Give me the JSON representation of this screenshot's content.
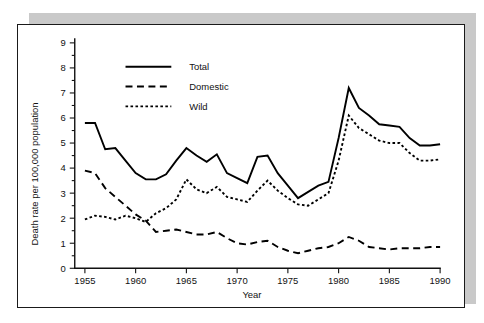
{
  "figure": {
    "panel_background": "#ffffff",
    "border_color": "#1a1a1a",
    "shadow_color": "#c9c9c9"
  },
  "chart_data": {
    "type": "line",
    "title": "",
    "xlabel": "Year",
    "ylabel": "Death rate per 100,000 population",
    "xlim": [
      1954,
      1990
    ],
    "ylim": [
      0,
      9
    ],
    "xticks": [
      1955,
      1960,
      1965,
      1970,
      1975,
      1980,
      1985,
      1990
    ],
    "xtick_labels": [
      "1955",
      "1960",
      "1965",
      "1970",
      "1975",
      "1980",
      "1985",
      "1990"
    ],
    "yticks": [
      0,
      1,
      2,
      3,
      4,
      5,
      6,
      7,
      8,
      9
    ],
    "ytick_labels": [
      "0",
      "1",
      "2",
      "3",
      "4",
      "5",
      "6",
      "7",
      "8",
      "9"
    ],
    "y_minor_ticks": true,
    "grid": false,
    "legend_position": "upper-left",
    "x": [
      1955,
      1956,
      1957,
      1958,
      1959,
      1960,
      1961,
      1962,
      1963,
      1964,
      1965,
      1966,
      1967,
      1968,
      1969,
      1970,
      1971,
      1972,
      1973,
      1974,
      1975,
      1976,
      1977,
      1978,
      1979,
      1980,
      1981,
      1982,
      1983,
      1984,
      1985,
      1986,
      1987,
      1988,
      1989,
      1990
    ],
    "series": [
      {
        "name": "Total",
        "line_style": "solid",
        "color": "#000000",
        "values": [
          5.8,
          5.8,
          4.75,
          4.8,
          4.3,
          3.8,
          3.55,
          3.55,
          3.75,
          4.3,
          4.8,
          4.5,
          4.25,
          4.55,
          3.8,
          3.6,
          3.4,
          4.45,
          4.5,
          3.8,
          3.3,
          2.8,
          3.05,
          3.3,
          3.45,
          5.2,
          7.2,
          6.4,
          6.1,
          5.75,
          5.7,
          5.65,
          5.2,
          4.9,
          4.9,
          4.95
        ]
      },
      {
        "name": "Domestic",
        "line_style": "dashed",
        "color": "#000000",
        "values": [
          3.9,
          3.8,
          3.2,
          2.85,
          2.5,
          2.15,
          1.9,
          1.45,
          1.5,
          1.55,
          1.45,
          1.35,
          1.35,
          1.45,
          1.2,
          1.0,
          0.95,
          1.05,
          1.1,
          0.85,
          0.7,
          0.6,
          0.7,
          0.8,
          0.85,
          1.0,
          1.25,
          1.1,
          0.85,
          0.8,
          0.75,
          0.8,
          0.8,
          0.8,
          0.85,
          0.85
        ]
      },
      {
        "name": "Wild",
        "line_style": "dotted",
        "color": "#000000",
        "values": [
          1.95,
          2.1,
          2.05,
          1.95,
          2.1,
          2.0,
          1.85,
          2.2,
          2.4,
          2.75,
          3.55,
          3.15,
          3.0,
          3.25,
          2.85,
          2.75,
          2.65,
          3.1,
          3.5,
          3.1,
          2.8,
          2.55,
          2.5,
          2.75,
          3.0,
          4.3,
          6.1,
          5.6,
          5.35,
          5.1,
          5.0,
          5.0,
          4.6,
          4.3,
          4.3,
          4.35
        ]
      }
    ],
    "legend": [
      {
        "label": "Total",
        "line_style": "solid"
      },
      {
        "label": "Domestic",
        "line_style": "dashed"
      },
      {
        "label": "Wild",
        "line_style": "dotted"
      }
    ]
  }
}
